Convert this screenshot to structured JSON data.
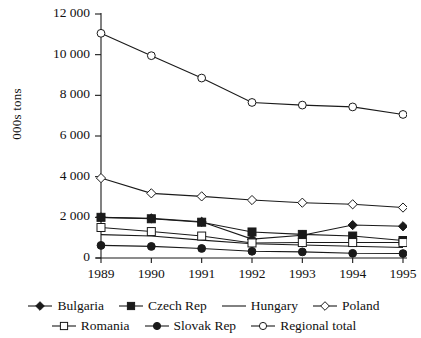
{
  "chart_data": {
    "type": "line",
    "title": "",
    "xlabel": "",
    "ylabel": "000s tons",
    "categories": [
      "1989",
      "1990",
      "1991",
      "1992",
      "1993",
      "1994",
      "1995"
    ],
    "ylim": [
      0,
      12000
    ],
    "yticks": [
      "0",
      "2 000",
      "4 000",
      "6 000",
      "8 000",
      "10 000",
      "12 000"
    ],
    "ytick_values": [
      0,
      2000,
      4000,
      6000,
      8000,
      10000,
      12000
    ],
    "grid": false,
    "legend_position": "bottom",
    "series": [
      {
        "name": "Bulgaria",
        "marker": "filled-diamond",
        "values": [
          2000,
          1950,
          1780,
          930,
          1120,
          1620,
          1560
        ]
      },
      {
        "name": "Czech Rep",
        "marker": "filled-square",
        "values": [
          2000,
          1930,
          1760,
          1280,
          1160,
          1080,
          860
        ]
      },
      {
        "name": "Hungary",
        "marker": "none",
        "values": [
          1150,
          1080,
          880,
          700,
          640,
          580,
          520
        ]
      },
      {
        "name": "Poland",
        "marker": "open-diamond",
        "values": [
          3930,
          3180,
          3030,
          2850,
          2720,
          2640,
          2480
        ]
      },
      {
        "name": "Romania",
        "marker": "open-square",
        "values": [
          1500,
          1300,
          1080,
          740,
          760,
          760,
          760
        ]
      },
      {
        "name": "Slovak Rep",
        "marker": "filled-circle",
        "values": [
          620,
          570,
          470,
          330,
          300,
          230,
          220
        ]
      },
      {
        "name": "Regional total",
        "marker": "open-circle",
        "values": [
          11050,
          9950,
          8850,
          7650,
          7520,
          7430,
          7060
        ]
      }
    ]
  },
  "axis": {
    "y_axis_label": "000s tons"
  },
  "legend": {
    "rows": [
      [
        {
          "label": "Bulgaria",
          "marker": "filled-diamond"
        },
        {
          "label": "Czech Rep",
          "marker": "filled-square"
        },
        {
          "label": "Hungary",
          "marker": "none"
        },
        {
          "label": "Poland",
          "marker": "open-diamond"
        }
      ],
      [
        {
          "label": "Romania",
          "marker": "open-square"
        },
        {
          "label": "Slovak Rep",
          "marker": "filled-circle"
        },
        {
          "label": "Regional total",
          "marker": "open-circle"
        }
      ]
    ]
  },
  "colors": {
    "line": "#1a1a1a",
    "axis": "#1a1a1a",
    "background": "#ffffff",
    "marker_fill_open": "#ffffff"
  }
}
